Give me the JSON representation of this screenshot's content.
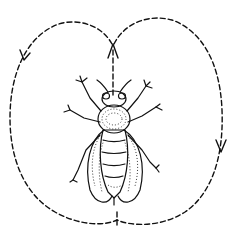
{
  "figure": {
    "subject": "bee",
    "colors": {
      "background": "#ffffff",
      "ink": "#111111"
    },
    "path": {
      "style": "dashed",
      "loops": [
        "left-loop",
        "right-loop"
      ],
      "arrows": [
        {
          "position": "left-loop-upper",
          "direction": "down"
        },
        {
          "position": "center-top",
          "direction": "up"
        },
        {
          "position": "right-loop-lower",
          "direction": "down"
        }
      ]
    }
  }
}
